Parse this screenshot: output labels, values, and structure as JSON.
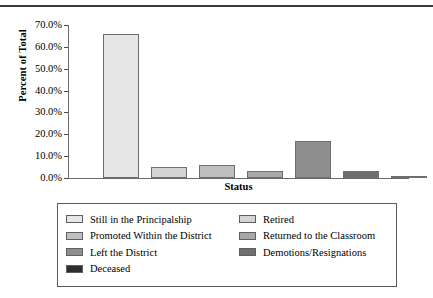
{
  "chart_data": {
    "type": "bar",
    "title": "",
    "xlabel": "Status",
    "ylabel": "Percent of Total",
    "ylim": [
      0,
      70
    ],
    "grid": false,
    "legend_position": "bottom",
    "ytick_labels": [
      "70.0%",
      "60.0%",
      "50.0%",
      "40.0%",
      "30.0%",
      "20.0%",
      "10.0%",
      "0.0%"
    ],
    "ytick_values": [
      70,
      60,
      50,
      40,
      30,
      20,
      10,
      0
    ],
    "categories": [
      "Still in the Principalship",
      "Retired",
      "Promoted Within the District",
      "Returned to the Classroom",
      "Left the District",
      "Demotions/Resignations",
      "Deceased"
    ],
    "values": [
      66.1,
      5.0,
      6.0,
      3.2,
      16.9,
      3.0,
      1.0
    ],
    "colors": [
      "#e6e6e6",
      "#d4d4d4",
      "#bfbfbf",
      "#a8a8a8",
      "#8e8e8e",
      "#6e6e6e",
      "#2e2e2e"
    ]
  },
  "legend": {
    "left_column": [
      {
        "label": "Still in the Principalship",
        "color": "#e6e6e6"
      },
      {
        "label": "Promoted Within the District",
        "color": "#bfbfbf"
      },
      {
        "label": "Left the District",
        "color": "#8e8e8e"
      },
      {
        "label": "Deceased",
        "color": "#2e2e2e"
      }
    ],
    "right_column": [
      {
        "label": "Retired",
        "color": "#d4d4d4"
      },
      {
        "label": "Returned to the Classroom",
        "color": "#a8a8a8"
      },
      {
        "label": "Demotions/Resignations",
        "color": "#6e6e6e"
      }
    ]
  }
}
